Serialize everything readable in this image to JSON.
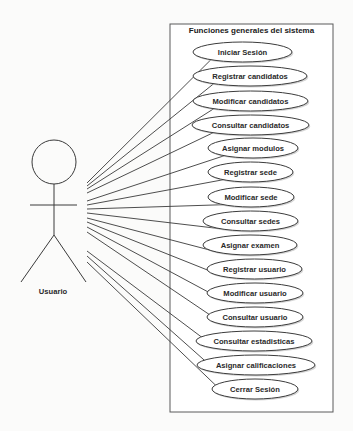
{
  "diagram": {
    "type": "use-case",
    "system": {
      "title": "Funciones generales del sistema",
      "box": {
        "x": 170,
        "y": 24,
        "w": 163,
        "h": 388
      }
    },
    "actor": {
      "label": "Usuario",
      "head": {
        "cx": 54,
        "cy": 162,
        "r": 22
      },
      "neck_y": 184,
      "arms": {
        "y": 205,
        "x1": 30,
        "x2": 77
      },
      "hip_y": 235,
      "legs": {
        "left": [
          21,
          282
        ],
        "right": [
          86,
          282
        ]
      },
      "label_pos": {
        "x": 53,
        "y": 294
      }
    },
    "use_cases": [
      {
        "label": "Iniciar Sesión",
        "x1": 193,
        "x2": 292,
        "cy": 52,
        "from_y": 183
      },
      {
        "label": "Registrar candidatos",
        "x1": 193,
        "x2": 307,
        "cy": 76,
        "from_y": 186
      },
      {
        "label": "Modificar candidatos",
        "x1": 193,
        "x2": 308,
        "cy": 101,
        "from_y": 189
      },
      {
        "label": "Consultar candidatos",
        "x1": 192,
        "x2": 309,
        "cy": 125,
        "from_y": 193
      },
      {
        "label": "Asignar modulos",
        "x1": 208,
        "x2": 298,
        "cy": 148,
        "from_y": 201
      },
      {
        "label": "Registrar sede",
        "x1": 208,
        "x2": 293,
        "cy": 172,
        "from_y": 205
      },
      {
        "label": "Modificar sede",
        "x1": 208,
        "x2": 294,
        "cy": 197,
        "from_y": 209
      },
      {
        "label": "Consultar sedes",
        "x1": 203,
        "x2": 298,
        "cy": 221,
        "from_y": 213
      },
      {
        "label": "Asignar examen",
        "x1": 203,
        "x2": 297,
        "cy": 245,
        "from_y": 218
      },
      {
        "label": "Registrar usuario",
        "x1": 207,
        "x2": 302,
        "cy": 269,
        "from_y": 222
      },
      {
        "label": "Modificar usuario",
        "x1": 207,
        "x2": 303,
        "cy": 293,
        "from_y": 227
      },
      {
        "label": "Consultar usuario",
        "x1": 207,
        "x2": 303,
        "cy": 317,
        "from_y": 232
      },
      {
        "label": "Consultar estadisticas",
        "x1": 196,
        "x2": 312,
        "cy": 341,
        "from_y": 251
      },
      {
        "label": "Asignar calificaciones",
        "x1": 197,
        "x2": 315,
        "cy": 365,
        "from_y": 256
      },
      {
        "label": "Cerrar Sesión",
        "x1": 212,
        "x2": 298,
        "cy": 389,
        "from_y": 262
      }
    ],
    "ellipse_ry": 10,
    "line_from_x": 87
  }
}
